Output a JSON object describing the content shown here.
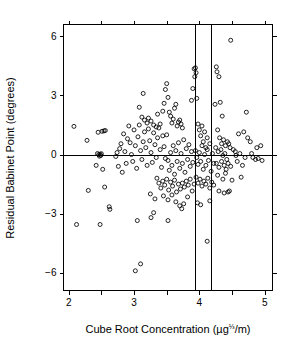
{
  "chart_data": {
    "type": "scatter",
    "title": "",
    "xlabel": "Cube Root Concentration (µg⅓/m)",
    "xlabel_parts": {
      "main": "Cube Root Concentration (µg",
      "superscript": "⅓",
      "tail": "/m)"
    },
    "ylabel": "Residual Babinet Point (degrees)",
    "xlim": [
      1.92,
      5.12
    ],
    "ylim": [
      -6.9,
      6.6
    ],
    "xticks": [
      2,
      3,
      4,
      5
    ],
    "xtick_labels": [
      "2",
      "3",
      "4",
      "5"
    ],
    "xticks_minor": [
      2.5,
      3.5,
      4.5
    ],
    "yticks": [
      -6,
      -3,
      0,
      3,
      6
    ],
    "ytick_labels": [
      "−6",
      "−3",
      "0",
      "3",
      "6"
    ],
    "grid": false,
    "legend": null,
    "marker": "open-circle",
    "marker_radius": 2.0,
    "reference_lines": {
      "horizontal": [
        0
      ],
      "vertical": [
        3.93,
        4.18
      ]
    },
    "points": [
      [
        2.08,
        1.43
      ],
      [
        2.12,
        -3.55
      ],
      [
        2.28,
        0.72
      ],
      [
        2.3,
        -1.82
      ],
      [
        2.44,
        0.05
      ],
      [
        2.46,
        0.0
      ],
      [
        2.47,
        -0.08
      ],
      [
        2.48,
        0.02
      ],
      [
        2.49,
        -0.05
      ],
      [
        2.5,
        0.04
      ],
      [
        2.45,
        1.13
      ],
      [
        2.51,
        1.18
      ],
      [
        2.54,
        1.2
      ],
      [
        2.56,
        1.22
      ],
      [
        2.42,
        -0.55
      ],
      [
        2.52,
        -0.75
      ],
      [
        2.55,
        -1.65
      ],
      [
        2.62,
        -2.65
      ],
      [
        2.63,
        -2.78
      ],
      [
        2.48,
        -3.55
      ],
      [
        2.72,
        -0.1
      ],
      [
        2.74,
        0.1
      ],
      [
        2.76,
        -0.6
      ],
      [
        2.78,
        0.3
      ],
      [
        2.8,
        0.55
      ],
      [
        2.82,
        -0.9
      ],
      [
        2.84,
        1.05
      ],
      [
        2.86,
        0.15
      ],
      [
        2.88,
        -0.45
      ],
      [
        2.9,
        0.8
      ],
      [
        2.92,
        1.45
      ],
      [
        2.94,
        0.6
      ],
      [
        2.96,
        0.0
      ],
      [
        2.98,
        -0.35
      ],
      [
        3.0,
        1.25
      ],
      [
        3.02,
        0.45
      ],
      [
        3.04,
        -0.7
      ],
      [
        3.06,
        0.9
      ],
      [
        3.08,
        1.5
      ],
      [
        3.1,
        0.2
      ],
      [
        3.12,
        -0.25
      ],
      [
        3.14,
        0.65
      ],
      [
        3.16,
        1.15
      ],
      [
        3.18,
        0.35
      ],
      [
        3.2,
        -0.55
      ],
      [
        3.22,
        1.3
      ],
      [
        3.24,
        0.7
      ],
      [
        3.26,
        0.1
      ],
      [
        3.28,
        -0.4
      ],
      [
        3.3,
        1.1
      ],
      [
        3.32,
        0.5
      ],
      [
        3.34,
        -0.15
      ],
      [
        3.36,
        0.85
      ],
      [
        3.38,
        1.35
      ],
      [
        3.4,
        0.25
      ],
      [
        3.42,
        -0.65
      ],
      [
        3.44,
        0.95
      ],
      [
        3.46,
        0.4
      ],
      [
        3.48,
        -0.2
      ],
      [
        3.5,
        1.0
      ],
      [
        3.05,
        -3.35
      ],
      [
        3.1,
        -5.55
      ],
      [
        3.02,
        -5.9
      ],
      [
        3.08,
        2.4
      ],
      [
        3.12,
        1.9
      ],
      [
        3.14,
        3.1
      ],
      [
        3.16,
        1.75
      ],
      [
        3.2,
        1.6
      ],
      [
        3.22,
        1.85
      ],
      [
        3.26,
        1.7
      ],
      [
        3.3,
        1.5
      ],
      [
        3.34,
        1.4
      ],
      [
        3.36,
        2.05
      ],
      [
        3.4,
        1.55
      ],
      [
        3.44,
        2.2
      ],
      [
        3.46,
        2.6
      ],
      [
        3.48,
        3.3
      ],
      [
        3.5,
        3.6
      ],
      [
        3.52,
        2.9
      ],
      [
        3.54,
        2.15
      ],
      [
        3.56,
        1.95
      ],
      [
        3.58,
        1.6
      ],
      [
        3.6,
        1.8
      ],
      [
        3.62,
        2.35
      ],
      [
        3.64,
        2.55
      ],
      [
        3.66,
        1.45
      ],
      [
        3.68,
        1.65
      ],
      [
        3.7,
        1.75
      ],
      [
        3.72,
        1.55
      ],
      [
        3.74,
        1.35
      ],
      [
        3.52,
        -0.3
      ],
      [
        3.54,
        -0.8
      ],
      [
        3.56,
        0.1
      ],
      [
        3.58,
        -0.55
      ],
      [
        3.6,
        0.45
      ],
      [
        3.62,
        -1.0
      ],
      [
        3.64,
        0.2
      ],
      [
        3.66,
        -0.35
      ],
      [
        3.68,
        0.6
      ],
      [
        3.7,
        -0.7
      ],
      [
        3.72,
        0.05
      ],
      [
        3.74,
        -0.45
      ],
      [
        3.76,
        0.75
      ],
      [
        3.78,
        -0.9
      ],
      [
        3.8,
        0.3
      ],
      [
        3.82,
        -0.25
      ],
      [
        3.84,
        0.5
      ],
      [
        3.86,
        -0.6
      ],
      [
        3.88,
        0.15
      ],
      [
        3.9,
        -0.4
      ],
      [
        3.35,
        -1.2
      ],
      [
        3.38,
        -1.45
      ],
      [
        3.41,
        -1.7
      ],
      [
        3.44,
        -1.35
      ],
      [
        3.47,
        -1.55
      ],
      [
        3.5,
        -1.25
      ],
      [
        3.53,
        -1.8
      ],
      [
        3.56,
        -1.4
      ],
      [
        3.59,
        -1.6
      ],
      [
        3.62,
        -1.3
      ],
      [
        3.65,
        -1.9
      ],
      [
        3.68,
        -1.5
      ],
      [
        3.71,
        -1.75
      ],
      [
        3.74,
        -1.45
      ],
      [
        3.77,
        -1.65
      ],
      [
        3.8,
        -1.35
      ],
      [
        3.83,
        -1.55
      ],
      [
        3.86,
        -1.25
      ],
      [
        3.89,
        -1.85
      ],
      [
        3.92,
        -1.5
      ],
      [
        3.25,
        -2.0
      ],
      [
        3.32,
        -2.25
      ],
      [
        3.45,
        -2.1
      ],
      [
        3.52,
        -2.3
      ],
      [
        3.58,
        -2.05
      ],
      [
        3.64,
        -2.4
      ],
      [
        3.7,
        -2.6
      ],
      [
        3.73,
        -2.75
      ],
      [
        3.76,
        -2.5
      ],
      [
        3.82,
        -2.15
      ],
      [
        3.26,
        -3.2
      ],
      [
        3.52,
        -3.35
      ],
      [
        3.3,
        -2.95
      ],
      [
        3.88,
        2.75
      ],
      [
        3.9,
        3.35
      ],
      [
        3.92,
        4.35
      ],
      [
        3.94,
        4.4
      ],
      [
        3.95,
        4.15
      ],
      [
        3.93,
        3.95
      ],
      [
        3.96,
        2.85
      ],
      [
        3.98,
        1.55
      ],
      [
        4.0,
        1.25
      ],
      [
        4.02,
        0.95
      ],
      [
        4.04,
        1.45
      ],
      [
        4.06,
        0.65
      ],
      [
        4.08,
        1.15
      ],
      [
        4.1,
        0.35
      ],
      [
        4.12,
        0.85
      ],
      [
        3.94,
        0.2
      ],
      [
        3.96,
        -0.15
      ],
      [
        3.98,
        -0.5
      ],
      [
        4.0,
        0.1
      ],
      [
        4.02,
        -0.35
      ],
      [
        4.04,
        0.45
      ],
      [
        4.06,
        -0.75
      ],
      [
        4.08,
        0.0
      ],
      [
        4.1,
        -0.55
      ],
      [
        4.12,
        0.25
      ],
      [
        4.14,
        -0.3
      ],
      [
        4.16,
        0.55
      ],
      [
        4.18,
        -0.85
      ],
      [
        4.2,
        0.05
      ],
      [
        4.22,
        -0.45
      ],
      [
        3.95,
        -1.15
      ],
      [
        3.98,
        -1.45
      ],
      [
        4.01,
        -1.25
      ],
      [
        4.04,
        -1.6
      ],
      [
        4.07,
        -1.35
      ],
      [
        4.1,
        -1.5
      ],
      [
        4.13,
        -1.2
      ],
      [
        4.16,
        -1.7
      ],
      [
        4.19,
        -1.4
      ],
      [
        4.22,
        -1.55
      ],
      [
        3.97,
        -2.45
      ],
      [
        4.02,
        -2.55
      ],
      [
        4.12,
        -4.4
      ],
      [
        4.16,
        -2.35
      ],
      [
        4.26,
        4.45
      ],
      [
        4.27,
        4.2
      ],
      [
        4.3,
        3.95
      ],
      [
        4.32,
        2.65
      ],
      [
        4.35,
        1.95
      ],
      [
        4.24,
        2.55
      ],
      [
        4.28,
        1.25
      ],
      [
        4.31,
        0.85
      ],
      [
        4.34,
        0.55
      ],
      [
        4.37,
        0.75
      ],
      [
        4.4,
        0.45
      ],
      [
        4.43,
        0.65
      ],
      [
        4.25,
        0.35
      ],
      [
        4.29,
        0.15
      ],
      [
        4.33,
        0.25
      ],
      [
        4.36,
        -0.05
      ],
      [
        4.39,
        0.05
      ],
      [
        4.42,
        -0.25
      ],
      [
        4.45,
        0.55
      ],
      [
        4.47,
        0.35
      ],
      [
        4.26,
        -0.45
      ],
      [
        4.3,
        -0.65
      ],
      [
        4.34,
        -0.35
      ],
      [
        4.38,
        -0.55
      ],
      [
        4.41,
        -0.75
      ],
      [
        4.44,
        -0.45
      ],
      [
        4.48,
        -0.6
      ],
      [
        4.28,
        -1.05
      ],
      [
        4.36,
        -1.25
      ],
      [
        4.4,
        -0.95
      ],
      [
        4.3,
        -1.85
      ],
      [
        4.38,
        -1.95
      ],
      [
        4.44,
        -1.9
      ],
      [
        4.46,
        -1.85
      ],
      [
        4.5,
        -1.3
      ],
      [
        4.48,
        5.8
      ],
      [
        4.55,
        0.15
      ],
      [
        4.58,
        -0.35
      ],
      [
        4.62,
        0.05
      ],
      [
        4.66,
        -0.55
      ],
      [
        4.7,
        -0.15
      ],
      [
        4.6,
        1.05
      ],
      [
        4.64,
        -1.15
      ],
      [
        4.72,
        2.15
      ],
      [
        4.78,
        0.65
      ],
      [
        4.8,
        0.05
      ],
      [
        4.82,
        -0.15
      ],
      [
        4.86,
        -0.25
      ],
      [
        4.9,
        -0.2
      ],
      [
        4.94,
        0.45
      ],
      [
        4.96,
        -0.3
      ],
      [
        4.74,
        0.85
      ],
      [
        4.68,
        1.15
      ],
      [
        4.56,
        -0.05
      ],
      [
        4.52,
        0.25
      ],
      [
        4.88,
        0.35
      ]
    ]
  },
  "figure": {
    "width": 291,
    "height": 342,
    "background": "#ffffff",
    "foreground": "#000000"
  }
}
